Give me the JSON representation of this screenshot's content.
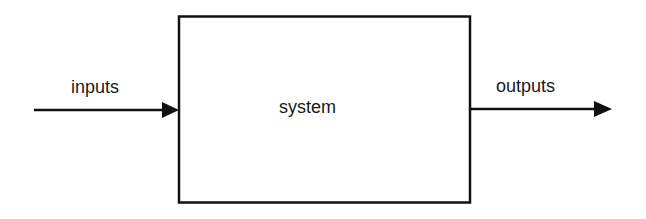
{
  "diagram": {
    "type": "block-diagram",
    "nodes": [
      {
        "id": "system",
        "label": "system",
        "shape": "rectangle"
      }
    ],
    "edges": [
      {
        "id": "inputs",
        "label": "inputs",
        "from": "external",
        "to": "system",
        "direction": "right"
      },
      {
        "id": "outputs",
        "label": "outputs",
        "from": "system",
        "to": "external",
        "direction": "right"
      }
    ]
  },
  "labels": {
    "inputs": "inputs",
    "system": "system",
    "outputs": "outputs"
  },
  "colors": {
    "stroke": "#111111",
    "text": "#1a1a1a",
    "background": "#ffffff"
  }
}
